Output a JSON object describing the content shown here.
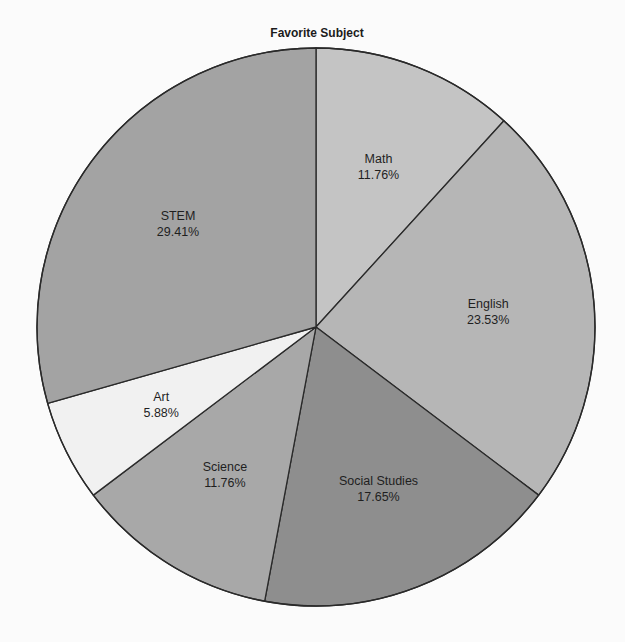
{
  "chart_data": {
    "type": "pie",
    "title": "Favorite Subject",
    "start_angle": "12 o'clock",
    "direction": "clockwise",
    "categories": [
      "Math",
      "English",
      "Social Studies",
      "Science",
      "Art",
      "STEM"
    ],
    "values": [
      11.76,
      23.53,
      17.65,
      11.76,
      5.88,
      29.41
    ],
    "labels": [
      "11.76%",
      "23.53%",
      "17.65%",
      "11.76%",
      "5.88%",
      "29.41%"
    ],
    "colors": [
      "#c4c4c4",
      "#b6b6b6",
      "#8e8e8e",
      "#a8a8a8",
      "#f1f1f1",
      "#a3a3a3"
    ],
    "legend": "none",
    "stroke_color": "#2a2a2a"
  },
  "geometry": {
    "cx": 316,
    "cy": 327,
    "r": 279
  }
}
